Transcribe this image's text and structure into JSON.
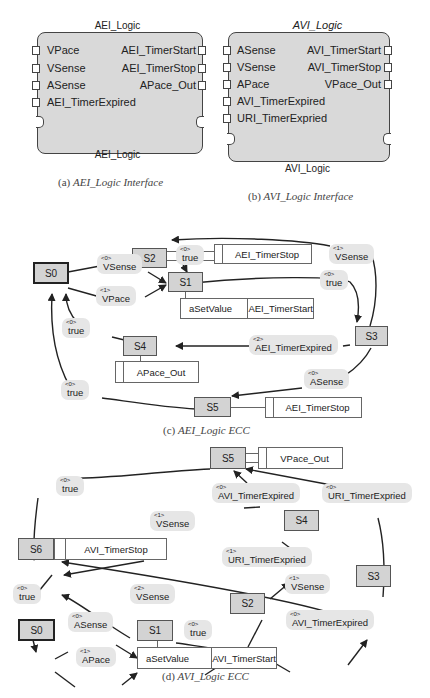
{
  "figure_a": {
    "title": "AEI_Logic",
    "inputs": [
      "VPace",
      "VSense",
      "ASense",
      "AEI_TimerExpired"
    ],
    "outputs": [
      "AEI_TimerStart",
      "AEI_TimerStop",
      "APace_Out"
    ],
    "body_label": "AEI_Logic",
    "caption_prefix": "(a)",
    "caption_text": "AEI_Logic Interface"
  },
  "figure_b": {
    "title": "AVI_Logic",
    "inputs": [
      "ASense",
      "VSense",
      "APace",
      "AVI_TimerExpired",
      "URI_TimerExpried"
    ],
    "outputs": [
      "AVI_TimerStart",
      "AVI_TimerStop",
      "VPace_Out"
    ],
    "body_label": "AVI_Logic",
    "caption_prefix": "(b)",
    "caption_text": "AVI_Logic Interface"
  },
  "figure_c": {
    "caption_prefix": "(c)",
    "caption_text": "AEI_Logic ECC",
    "states": {
      "s0": "S0",
      "s1": "S1",
      "s2": "S2",
      "s3": "S3",
      "s4": "S4",
      "s5": "S5"
    },
    "actions": {
      "s1_alg": "aSetValue",
      "s1_out": "AEI_TimerStart",
      "s2_out": "AEI_TimerStop",
      "s4_out": "APace_Out",
      "s5_out": "AEI_TimerStop"
    },
    "transitions": [
      {
        "from": "S0",
        "to": "S1",
        "priority": "<0>",
        "condition": "VSense"
      },
      {
        "from": "S0",
        "to": "S1",
        "priority": "<1>",
        "condition": "VPace"
      },
      {
        "from": "S2",
        "to": "S1",
        "priority": "<0>",
        "condition": "true"
      },
      {
        "from": "S1",
        "to": "S3",
        "priority": "<0>",
        "condition": "true"
      },
      {
        "from": "S3",
        "to": "S2",
        "priority": "<1>",
        "condition": "VSense"
      },
      {
        "from": "S3",
        "to": "S4",
        "priority": "<2>",
        "condition": "AEI_TimerExpired"
      },
      {
        "from": "S3",
        "to": "S5",
        "priority": "<0>",
        "condition": "ASense"
      },
      {
        "from": "S4",
        "to": "S0",
        "priority": "<0>",
        "condition": "true"
      },
      {
        "from": "S5",
        "to": "S0",
        "priority": "<0>",
        "condition": "true"
      }
    ]
  },
  "figure_d": {
    "caption_prefix": "(d)",
    "caption_text": "AVI_Logic ECC",
    "states": {
      "s0": "S0",
      "s1": "S1",
      "s2": "S2",
      "s3": "S3",
      "s4": "S4",
      "s5": "S5",
      "s6": "S6"
    },
    "actions": {
      "s1_alg": "aSetValue",
      "s1_out": "AVI_TimerStart",
      "s5_out": "VPace_Out",
      "s6_out": "AVI_TimerStop"
    },
    "transitions": [
      {
        "from": "S0",
        "to": "S1",
        "priority": "<0>",
        "condition": "ASense"
      },
      {
        "from": "S0",
        "to": "S1",
        "priority": "<1>",
        "condition": "APace"
      },
      {
        "from": "S1",
        "to": "S2",
        "priority": "<0>",
        "condition": "true"
      },
      {
        "from": "S2",
        "to": "S4",
        "priority": "<1>",
        "condition": "URI_TimerExpried"
      },
      {
        "from": "S2",
        "to": "S3",
        "priority": "<0>",
        "condition": "AVI_TimerExpired"
      },
      {
        "from": "S2",
        "to": "S6",
        "priority": "<2>",
        "condition": "VSense"
      },
      {
        "from": "S3",
        "to": "S6",
        "priority": "<1>",
        "condition": "VSense"
      },
      {
        "from": "S3",
        "to": "S5",
        "priority": "<0>",
        "condition": "URI_TimerExpried"
      },
      {
        "from": "S4",
        "to": "S5",
        "priority": "<0>",
        "condition": "AVI_TimerExpired"
      },
      {
        "from": "S4",
        "to": "S6",
        "priority": "<1>",
        "condition": "VSense"
      },
      {
        "from": "S5",
        "to": "S6",
        "priority": "<0>",
        "condition": "true"
      },
      {
        "from": "S6",
        "to": "S0",
        "priority": "<0>",
        "condition": "true"
      }
    ]
  }
}
